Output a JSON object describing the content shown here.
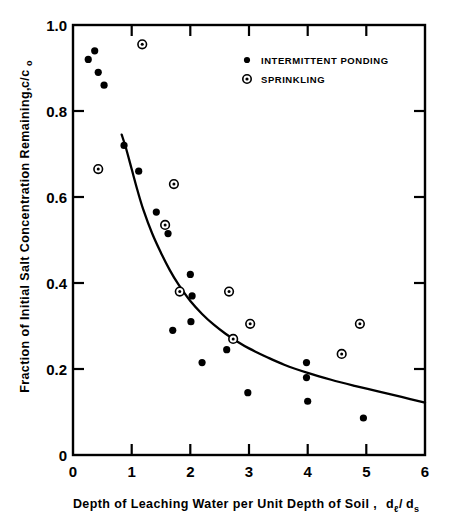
{
  "figure": {
    "background_color": "#ffffff",
    "ink_color": "#000000"
  },
  "chart_data": {
    "type": "scatter",
    "title": "",
    "xlabel": "Depth of Leaching Water per Unit Depth of Soil,  dₗ/dₛ",
    "xlabel_main": "Depth of Leaching Water per Unit Depth of Soil ,",
    "xlabel_symbol_num": "d",
    "xlabel_symbol_num_sub": "ℓ",
    "xlabel_symbol_slash": "/",
    "xlabel_symbol_den": "d",
    "xlabel_symbol_den_sub": "s",
    "ylabel": "Fraction of Initial Salt Concentration Remaining,  c/c₀",
    "ylabel_main": "Fraction of Initial Salt Concentration Remaining,",
    "ylabel_symbol": "c/c",
    "ylabel_symbol_sub": "o",
    "xlim": [
      0,
      6
    ],
    "ylim": [
      0,
      1.0
    ],
    "xticks": [
      0,
      1,
      2,
      3,
      4,
      5,
      6
    ],
    "xtick_labels": [
      "0",
      "1",
      "2",
      "3",
      "4",
      "5",
      "6"
    ],
    "yticks": [
      0,
      0.2,
      0.4,
      0.6,
      0.8,
      1.0
    ],
    "ytick_labels": [
      "0",
      "0.2",
      "0.4",
      "0.6",
      "0.8",
      "1.0"
    ],
    "grid": false,
    "legend_position": "upper-right-inside",
    "series": [
      {
        "name": "INTERMITTENT PONDING",
        "marker": "filled-circle",
        "color": "#000000",
        "points": [
          [
            0.26,
            0.92
          ],
          [
            0.37,
            0.94
          ],
          [
            0.43,
            0.89
          ],
          [
            0.53,
            0.86
          ],
          [
            0.87,
            0.72
          ],
          [
            1.12,
            0.66
          ],
          [
            1.42,
            0.565
          ],
          [
            1.62,
            0.515
          ],
          [
            2.0,
            0.42
          ],
          [
            2.03,
            0.37
          ],
          [
            1.7,
            0.29
          ],
          [
            2.01,
            0.31
          ],
          [
            2.2,
            0.215
          ],
          [
            2.62,
            0.245
          ],
          [
            2.98,
            0.145
          ],
          [
            3.98,
            0.215
          ],
          [
            3.98,
            0.18
          ],
          [
            4.0,
            0.125
          ],
          [
            4.95,
            0.086
          ]
        ]
      },
      {
        "name": "SPRINKLING",
        "marker": "dotted-circle",
        "color": "#000000",
        "points": [
          [
            0.43,
            0.665
          ],
          [
            1.18,
            0.955
          ],
          [
            1.72,
            0.63
          ],
          [
            1.57,
            0.535
          ],
          [
            1.82,
            0.38
          ],
          [
            2.66,
            0.38
          ],
          [
            2.73,
            0.27
          ],
          [
            3.02,
            0.305
          ],
          [
            4.58,
            0.235
          ],
          [
            4.89,
            0.305
          ]
        ]
      }
    ],
    "fit_curve": {
      "name": "fitted-decay-curve",
      "description": "Smooth monotonically decreasing curve fitted through the data",
      "points": [
        [
          0.83,
          0.745
        ],
        [
          0.9,
          0.715
        ],
        [
          1.0,
          0.665
        ],
        [
          1.1,
          0.615
        ],
        [
          1.2,
          0.57
        ],
        [
          1.35,
          0.515
        ],
        [
          1.5,
          0.47
        ],
        [
          1.65,
          0.43
        ],
        [
          1.8,
          0.396
        ],
        [
          2.0,
          0.358
        ],
        [
          2.2,
          0.328
        ],
        [
          2.4,
          0.303
        ],
        [
          2.6,
          0.282
        ],
        [
          2.8,
          0.264
        ],
        [
          3.0,
          0.248
        ],
        [
          3.3,
          0.228
        ],
        [
          3.6,
          0.21
        ],
        [
          4.0,
          0.191
        ],
        [
          4.4,
          0.175
        ],
        [
          4.8,
          0.161
        ],
        [
          5.2,
          0.148
        ],
        [
          5.6,
          0.135
        ],
        [
          6.0,
          0.122
        ]
      ]
    },
    "legend_entries": [
      {
        "label": "INTERMITTENT PONDING",
        "marker": "filled-circle"
      },
      {
        "label": "SPRINKLING",
        "marker": "dotted-circle"
      }
    ]
  }
}
